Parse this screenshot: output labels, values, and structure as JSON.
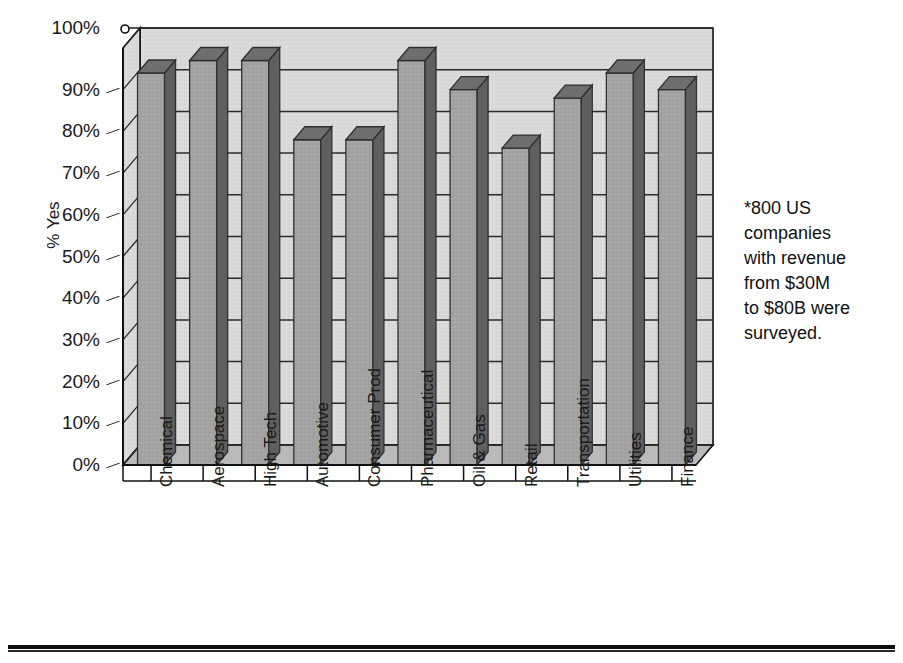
{
  "chart_data": {
    "type": "bar",
    "title": "",
    "subtitle": "",
    "xlabel": "",
    "ylabel": "% Yes",
    "ylim": [
      0,
      100
    ],
    "grid": true,
    "legend": "none",
    "three_d": true,
    "categories": [
      "Chemical",
      "Aerospace",
      "High Tech",
      "Automotive",
      "Consumer Prod",
      "Pharmaceutical",
      "Oil & Gas",
      "Retail",
      "Transportation",
      "Utilities",
      "Finance"
    ],
    "values": [
      94,
      97,
      97,
      78,
      78,
      97,
      90,
      76,
      88,
      94,
      90
    ],
    "y_ticks": [
      "0%",
      "10%",
      "20%",
      "30%",
      "40%",
      "50%",
      "60%",
      "70%",
      "80%",
      "90%",
      "100%"
    ],
    "y_tick_values": [
      0,
      10,
      20,
      30,
      40,
      50,
      60,
      70,
      80,
      90,
      100
    ],
    "annotations": [
      "*800 US companies with revenue from $30M to $80B were surveyed."
    ],
    "colors": {
      "bar_front": "#a3a3a3",
      "bar_side": "#5f5f5f",
      "bar_top": "#6e6e6e",
      "wall_back": "#d9d9d9",
      "wall_side": "#cfcfcf",
      "floor": "#bdbdbd",
      "gridline": "#2b2b2b",
      "axis": "#111111",
      "text": "#141414",
      "page_background": "#ffffff"
    }
  },
  "annotation": {
    "line1": "*800 US",
    "line2": "companies",
    "line3": "with revenue",
    "line4": "from $30M",
    "line5": "to $80B were",
    "line6": "surveyed."
  }
}
